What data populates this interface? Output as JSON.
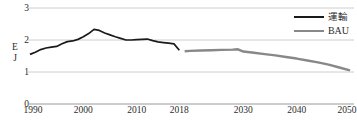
{
  "chart_data": {
    "type": "line",
    "title": "",
    "xlabel": "",
    "ylabel": "EJ",
    "ylim": [
      0,
      3
    ],
    "xlim": [
      1990,
      2050
    ],
    "yticks": [
      0,
      1,
      2,
      3
    ],
    "xticks": [
      1990,
      2000,
      2010,
      2018,
      2030,
      2040,
      2050
    ],
    "grid": "horizontal",
    "legend_position": "top-right",
    "series": [
      {
        "name": "運輸",
        "color": "#1a1a1a",
        "x": [
          1990,
          1991,
          1992,
          1993,
          1994,
          1995,
          1996,
          1997,
          1998,
          1999,
          2000,
          2001,
          2002,
          2003,
          2004,
          2005,
          2006,
          2007,
          2008,
          2009,
          2010,
          2011,
          2012,
          2013,
          2014,
          2015,
          2016,
          2017,
          2018
        ],
        "values": [
          1.55,
          1.62,
          1.7,
          1.75,
          1.78,
          1.8,
          1.88,
          1.95,
          1.97,
          2.02,
          2.1,
          2.2,
          2.33,
          2.3,
          2.22,
          2.16,
          2.1,
          2.05,
          2.0,
          2.0,
          2.01,
          2.02,
          2.03,
          1.98,
          1.94,
          1.92,
          1.9,
          1.88,
          1.68
        ]
      },
      {
        "name": "BAU",
        "color": "#888888",
        "x": [
          2019,
          2020,
          2022,
          2024,
          2026,
          2028,
          2029,
          2030,
          2032,
          2034,
          2036,
          2038,
          2040,
          2042,
          2044,
          2046,
          2048,
          2050
        ],
        "values": [
          1.65,
          1.66,
          1.67,
          1.68,
          1.69,
          1.7,
          1.71,
          1.64,
          1.6,
          1.56,
          1.52,
          1.47,
          1.42,
          1.36,
          1.3,
          1.23,
          1.14,
          1.05
        ]
      }
    ]
  },
  "legend": {
    "items": [
      {
        "label": "運輸",
        "color": "#1a1a1a",
        "width": 2.0
      },
      {
        "label": "BAU",
        "color": "#888888",
        "width": 2.6
      }
    ]
  },
  "axes": {
    "y_title_lines": [
      "E",
      "J"
    ],
    "y_tick_labels": [
      "3",
      "2",
      "1",
      "0"
    ],
    "x_tick_labels": [
      "1990",
      "2000",
      "2010",
      "2018",
      "2030",
      "2040",
      "2050"
    ]
  }
}
